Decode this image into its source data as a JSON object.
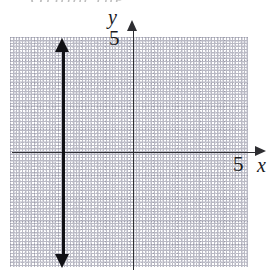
{
  "figure": {
    "kind": "coordinate-plane-graph",
    "cutoff_header_text": "Graph the",
    "background_color": "#ffffff",
    "ink_color": "#1a1a1e",
    "grid_major_color": "#9a9aa8",
    "grid_minor_color": "#d6d6de",
    "graph_line_color": "#111115"
  },
  "axes": {
    "x_label": "x",
    "y_label": "y",
    "x_tick_label": "5",
    "y_tick_label": "5",
    "x_arrow_icon": "arrow-right-icon",
    "y_arrow_icon": "arrow-up-icon"
  },
  "chart_data": {
    "type": "line",
    "title": "",
    "xlabel": "x",
    "ylabel": "y",
    "xlim": [
      -5,
      5
    ],
    "ylim": [
      -5,
      5
    ],
    "grid": true,
    "grid_style": "dotted",
    "legend": "none",
    "x_ticks": [
      5
    ],
    "y_ticks": [
      5
    ],
    "x_tick_labels": [
      "5"
    ],
    "y_tick_labels": [
      "5"
    ],
    "series": [
      {
        "name": "vertical line",
        "equation": "x = -3",
        "orientation": "vertical",
        "x": [
          -3,
          -3
        ],
        "y": [
          -5,
          5
        ],
        "arrows": "both",
        "style": "solid",
        "weight": "bold"
      }
    ],
    "annotations": []
  }
}
